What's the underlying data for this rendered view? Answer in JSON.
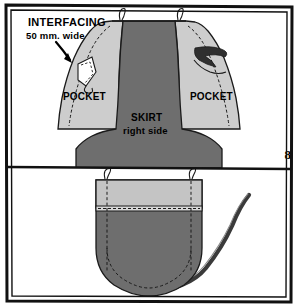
{
  "document": {
    "type": "sewing-instruction-illustration",
    "title": "Apron bib and pocket construction steps"
  },
  "colors": {
    "fabric_dark": "#6e6e6e",
    "fabric_light": "#cdcdcd",
    "band_light": "#c4c4c4",
    "outline": "#1a1a1a",
    "background": "#ffffff",
    "strap_dark": "#3a3a3a"
  },
  "figure8": {
    "number": "8",
    "annotation_title": "INTERFACING",
    "annotation_sub": "50 mm. wide",
    "pocket_left_label": "POCKET",
    "pocket_right_label": "POCKET",
    "skirt_label": "SKIRT",
    "skirt_sub": "right side",
    "icons": {
      "arrow": "down-arrow-icon",
      "interfacing_patch": "interfacing-wedge-icon",
      "strap": "apron-strap-icon"
    }
  },
  "figure9": {
    "number": "9",
    "right_side_label": "right side",
    "icons": {
      "pocket": "pocket-piece-icon",
      "binding": "binding-strip-icon",
      "seam": "stitch-seam-icon"
    }
  }
}
